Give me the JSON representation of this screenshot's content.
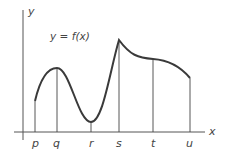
{
  "diagram": {
    "function_label": "y = f(x)",
    "y_axis_label": "y",
    "x_axis_label": "x",
    "points": [
      {
        "label": "p",
        "x": 35,
        "y": 101
      },
      {
        "label": "q",
        "x": 57,
        "y": 68
      },
      {
        "label": "r",
        "x": 91,
        "y": 122
      },
      {
        "label": "s",
        "x": 119,
        "y": 40
      },
      {
        "label": "t",
        "x": 153,
        "y": 59
      },
      {
        "label": "u",
        "x": 190,
        "y": 78
      }
    ],
    "colors": {
      "curve": "#3a3a3a",
      "axis": "#555555",
      "text": "#444444"
    }
  }
}
